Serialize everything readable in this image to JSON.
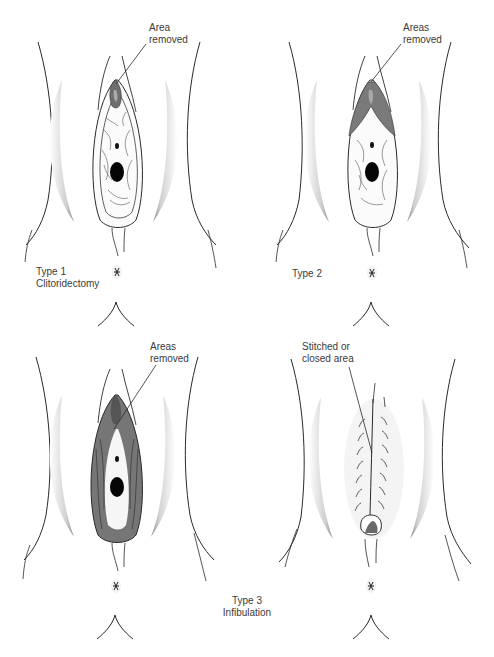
{
  "figure": {
    "panels": [
      {
        "id": "type1",
        "type_label": "Type 1",
        "name_label": "Clitoridectomy",
        "callout": [
          "Area",
          "removed"
        ],
        "shading": "clitoral-hood"
      },
      {
        "id": "type2",
        "type_label": "Type 2",
        "name_label": "",
        "callout": [
          "Areas",
          "removed"
        ],
        "shading": "clitoris-and-labia-minora"
      },
      {
        "id": "type3a",
        "type_label": "",
        "name_label": "",
        "callout": [
          "Areas",
          "removed"
        ],
        "shading": "clitoris-labia-minora-and-majora"
      },
      {
        "id": "type3b",
        "type_label": "",
        "name_label": "",
        "callout": [
          "Stitched or",
          "closed area"
        ],
        "shading": "stitched-closure"
      }
    ],
    "shared_label": {
      "type_label": "Type 3",
      "name_label": "Infibulation"
    },
    "colors": {
      "line": "#2a2a2a",
      "shade_dark": "#6e6e6e",
      "shade_mid": "#9a9a9a",
      "shade_light": "#d8d8d8",
      "background": "#ffffff"
    }
  }
}
